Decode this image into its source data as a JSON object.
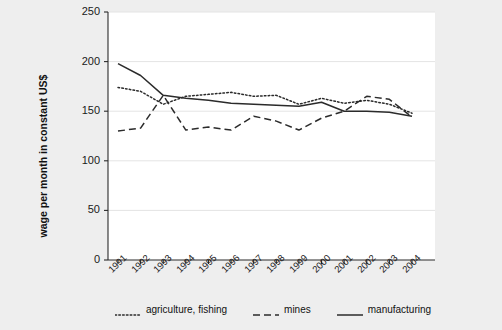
{
  "chart_data": {
    "type": "line",
    "title": "",
    "xlabel": "",
    "ylabel": "wage per month in constant US$",
    "categories": [
      "1991",
      "1992",
      "1993",
      "1994",
      "1995",
      "1996",
      "1997",
      "1998",
      "1999",
      "2000",
      "2001",
      "2002",
      "2003",
      "2004"
    ],
    "ylim": [
      0,
      250
    ],
    "yticks": [
      0,
      50,
      100,
      150,
      200,
      250
    ],
    "ytick_labels": [
      "0",
      "50",
      "100",
      "150",
      "200",
      "250"
    ],
    "grid": true,
    "legend_position": "bottom",
    "series": [
      {
        "name": "agriculture, fishing",
        "style": "dotted",
        "color": "#2b2b2b",
        "values": [
          174,
          170,
          157,
          165,
          167,
          169,
          165,
          166,
          157,
          163,
          158,
          161,
          157,
          148
        ]
      },
      {
        "name": "mines",
        "style": "dashed",
        "color": "#2b2b2b",
        "values": [
          130,
          133,
          166,
          131,
          134,
          131,
          145,
          140,
          131,
          143,
          150,
          165,
          162,
          144
        ]
      },
      {
        "name": "manufacturing",
        "style": "solid",
        "color": "#2b2b2b",
        "values": [
          198,
          186,
          166,
          163,
          161,
          158,
          157,
          156,
          155,
          159,
          150,
          150,
          149,
          145
        ]
      }
    ]
  },
  "figure": {
    "background_color": "#eeeeee",
    "plot_background_color": "#ffffff",
    "axis_color": "#2b2b2b",
    "grid_color": "#e4e4e4"
  }
}
